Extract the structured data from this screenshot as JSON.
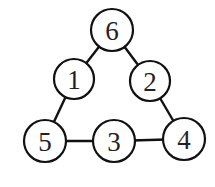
{
  "diagram": {
    "type": "number-triangle",
    "nodes": [
      {
        "id": "n6",
        "label": "6",
        "cx": 112,
        "cy": 30,
        "r": 21
      },
      {
        "id": "n1",
        "label": "1",
        "cx": 74,
        "cy": 79,
        "r": 20
      },
      {
        "id": "n2",
        "label": "2",
        "cx": 150,
        "cy": 81,
        "r": 20
      },
      {
        "id": "n5",
        "label": "5",
        "cx": 45,
        "cy": 141,
        "r": 21
      },
      {
        "id": "n3",
        "label": "3",
        "cx": 114,
        "cy": 141,
        "r": 21
      },
      {
        "id": "n4",
        "label": "4",
        "cx": 184,
        "cy": 139,
        "r": 21
      }
    ],
    "edges": [
      {
        "from": "n6",
        "to": "n1"
      },
      {
        "from": "n6",
        "to": "n2"
      },
      {
        "from": "n1",
        "to": "n5"
      },
      {
        "from": "n2",
        "to": "n4"
      },
      {
        "from": "n5",
        "to": "n3"
      },
      {
        "from": "n3",
        "to": "n4"
      }
    ]
  }
}
